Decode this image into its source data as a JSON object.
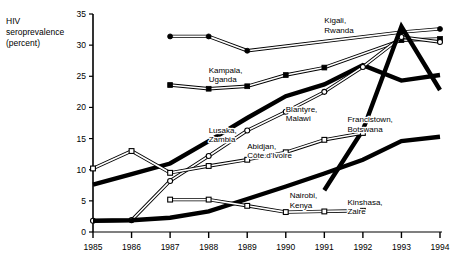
{
  "axis_title": "HIV\nseroprevalence\n(percent)",
  "chart_data": {
    "type": "line",
    "title": "",
    "xlabel": "",
    "ylabel": "HIV seroprevalence (percent)",
    "xlim": [
      1985,
      1994
    ],
    "ylim": [
      0,
      35
    ],
    "yticks": [
      0,
      5,
      10,
      15,
      20,
      25,
      30,
      35
    ],
    "xticks": [
      1985,
      1986,
      1987,
      1988,
      1989,
      1990,
      1991,
      1992,
      1993,
      1994
    ],
    "grid": false,
    "legend": "inline-annotations",
    "series": [
      {
        "name": "Kigali, Rwanda",
        "style": "thin-double-filled-circle",
        "label_x": 1991.0,
        "label_y": 33.5,
        "x": [
          1987.0,
          1988.0,
          1989.0,
          1993.0,
          1994.0
        ],
        "y": [
          31.4,
          31.4,
          29.1,
          32.1,
          32.6
        ]
      },
      {
        "name": "Kampala, Uganda",
        "style": "thin-double-filled-square",
        "label_x": 1988.0,
        "label_y": 25.6,
        "x": [
          1987.0,
          1988.0,
          1989.0,
          1990.0,
          1991.0,
          1993.0,
          1994.0
        ],
        "y": [
          23.6,
          23.0,
          23.4,
          25.2,
          26.4,
          30.8,
          31.0
        ]
      },
      {
        "name": "Lusaka, Zambia",
        "style": "thick-solid",
        "label_x": 1988.0,
        "label_y": 15.9,
        "x": [
          1985,
          1986,
          1987,
          1988,
          1989,
          1990,
          1991,
          1992,
          1993,
          1994
        ],
        "y": [
          7.6,
          9.3,
          11.0,
          14.6,
          18.3,
          21.8,
          23.7,
          26.8,
          24.3,
          25.2
        ]
      },
      {
        "name": "Blantyre, Malawi",
        "style": "thin-double-open-circle",
        "label_x": 1990.0,
        "label_y": 19.3,
        "x": [
          1985,
          1986,
          1987,
          1988,
          1989,
          1990,
          1991,
          1992,
          1993,
          1994
        ],
        "y": [
          1.8,
          1.9,
          8.2,
          12.2,
          16.3,
          19.3,
          22.5,
          26.5,
          31.3,
          30.5
        ]
      },
      {
        "name": "Francistown, Botswana",
        "style": "thick-solid",
        "label_x": 1991.6,
        "label_y": 17.6,
        "x": [
          1991,
          1992,
          1993,
          1994
        ],
        "y": [
          6.7,
          16.4,
          33.0,
          22.8
        ]
      },
      {
        "name": "Abidjan, Côte d'Ivoire",
        "style": "thin-double-open-square",
        "label_x": 1989.0,
        "label_y": 13.4,
        "x": [
          1985,
          1986,
          1987,
          1988,
          1989,
          1990,
          1991,
          1992
        ],
        "y": [
          10.2,
          13.0,
          9.5,
          10.6,
          11.6,
          12.8,
          14.8,
          15.9
        ]
      },
      {
        "name": "Nairobi, Kenya",
        "style": "thick-solid",
        "label_x": 1990.1,
        "label_y": 5.4,
        "x": [
          1985,
          1986,
          1987,
          1988,
          1989,
          1990,
          1991,
          1992,
          1993,
          1994
        ],
        "y": [
          1.8,
          1.9,
          2.3,
          3.3,
          5.3,
          7.3,
          9.4,
          11.6,
          14.6,
          15.3
        ]
      },
      {
        "name": "Kinshasa, Zaire",
        "style": "thin-double-open-square",
        "label_x": 1991.6,
        "label_y": 4.4,
        "x": [
          1987,
          1988,
          1989,
          1990,
          1991,
          1992
        ],
        "y": [
          5.2,
          5.2,
          4.2,
          3.2,
          3.3,
          3.4
        ]
      }
    ]
  },
  "labels": {
    "kigali": "Kigali,\nRwanda",
    "kampala": "Kampala,\nUganda",
    "lusaka": "Lusaka,\nZambia",
    "blantyre": "Blantyre,\nMalawi",
    "francistown": "Francistown,\nBotswana",
    "abidjan": "Abidjan,\nCôte d'Ivoire",
    "nairobi": "Nairobi,\nKenya",
    "kinshasa": "Kinshasa,\nZaire"
  }
}
